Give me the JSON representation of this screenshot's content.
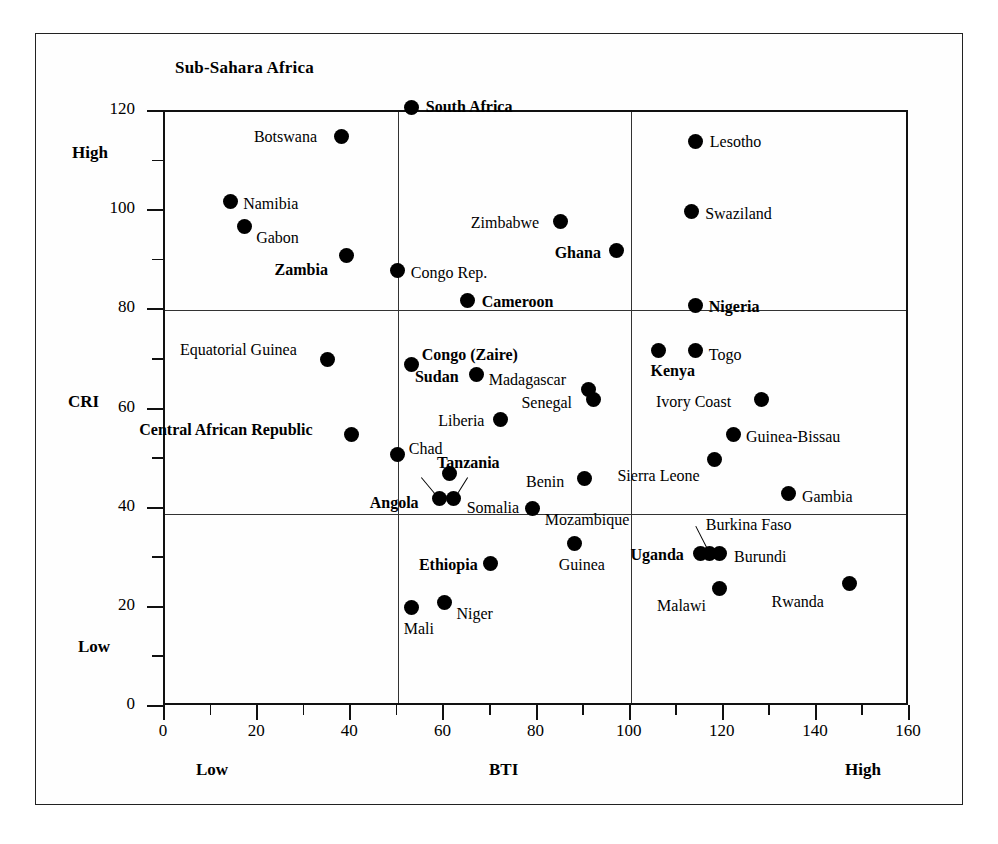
{
  "chart_data": {
    "type": "scatter",
    "title": "Sub-Sahara Africa",
    "xlabel": "BTI",
    "ylabel": "CRI",
    "xlim": [
      0,
      160
    ],
    "ylim": [
      0,
      120
    ],
    "xticks": [
      0,
      20,
      40,
      60,
      80,
      100,
      120,
      140,
      160
    ],
    "yticks": [
      0,
      20,
      40,
      60,
      80,
      100,
      120
    ],
    "xtick_minor_step": 10,
    "ytick_minor_step": 10,
    "grid": false,
    "legend": "none",
    "x_axis_low_label": "Low",
    "x_axis_high_label": "High",
    "y_axis_low_label": "Low",
    "y_axis_high_label": "High",
    "divider_x_values": [
      50,
      100
    ],
    "divider_y_values": [
      39,
      80
    ],
    "points": [
      {
        "name": "South Africa",
        "x": 53,
        "y": 121,
        "bold": true,
        "lx": 14,
        "ly": -8
      },
      {
        "name": "Botswana",
        "x": 38,
        "y": 115,
        "bold": false,
        "lx": -88,
        "ly": -8
      },
      {
        "name": "Lesotho",
        "x": 114,
        "y": 114,
        "bold": false,
        "lx": 14,
        "ly": -8
      },
      {
        "name": "Namibia",
        "x": 14,
        "y": 102,
        "bold": false,
        "lx": 13,
        "ly": -5
      },
      {
        "name": "Swaziland",
        "x": 113,
        "y": 100,
        "bold": false,
        "lx": 14,
        "ly": -5
      },
      {
        "name": "Gabon",
        "x": 17,
        "y": 97,
        "bold": false,
        "lx": 12,
        "ly": 4
      },
      {
        "name": "Zimbabwe",
        "x": 85,
        "y": 98,
        "bold": false,
        "lx": -90,
        "ly": -6
      },
      {
        "name": "Ghana",
        "x": 97,
        "y": 92,
        "bold": true,
        "lx": -62,
        "ly": -6
      },
      {
        "name": "Zambia",
        "x": 39,
        "y": 91,
        "bold": true,
        "lx": -72,
        "ly": 6
      },
      {
        "name": "Congo Rep.",
        "x": 50,
        "y": 88,
        "bold": false,
        "lx": 13,
        "ly": -6
      },
      {
        "name": "Cameroon",
        "x": 65,
        "y": 82,
        "bold": true,
        "lx": 14,
        "ly": -6
      },
      {
        "name": "Nigeria",
        "x": 114,
        "y": 81,
        "bold": true,
        "lx": 13,
        "ly": -6
      },
      {
        "name": "Equatorial Guinea",
        "x": 35,
        "y": 70,
        "bold": false,
        "lx": -148,
        "ly": -18
      },
      {
        "name": "Congo (Zaire)",
        "x": 53,
        "y": 69,
        "bold": true,
        "lx": 10,
        "ly": -18
      },
      {
        "name": "Kenya",
        "x": 106,
        "y": 72,
        "bold": true,
        "lx": -8,
        "ly": 13
      },
      {
        "name": "Togo",
        "x": 114,
        "y": 72,
        "bold": false,
        "lx": 13,
        "ly": -3
      },
      {
        "name": "Sudan",
        "x": 67,
        "y": 67,
        "bold": true,
        "lx": -62,
        "ly": -6
      },
      {
        "name": "Madagascar",
        "x": 91,
        "y": 64,
        "bold": false,
        "lx": -100,
        "ly": -18
      },
      {
        "name": "Senegal",
        "x": 92,
        "y": 62,
        "bold": false,
        "lx": -72,
        "ly": -5
      },
      {
        "name": "Ivory  Coast",
        "x": 128,
        "y": 62,
        "bold": false,
        "lx": -105,
        "ly": -6
      },
      {
        "name": "Liberia",
        "x": 72,
        "y": 58,
        "bold": false,
        "lx": -62,
        "ly": -6
      },
      {
        "name": "Central African Republic",
        "x": 40,
        "y": 55,
        "bold": true,
        "lx": -212,
        "ly": -12
      },
      {
        "name": "Guinea-Bissau",
        "x": 122,
        "y": 55,
        "bold": false,
        "lx": 13,
        "ly": -5
      },
      {
        "name": "Chad",
        "x": 50,
        "y": 51,
        "bold": false,
        "lx": 11,
        "ly": -13
      },
      {
        "name": "Sierra Leone",
        "x": 118,
        "y": 50,
        "bold": false,
        "lx": -97,
        "ly": 9
      },
      {
        "name": "Tanzania",
        "x": 61,
        "y": 47,
        "bold": true,
        "lx": -12,
        "ly": -19
      },
      {
        "name": "Benin",
        "x": 90,
        "y": 46,
        "bold": false,
        "lx": -58,
        "ly": -5
      },
      {
        "name": "Gambia",
        "x": 134,
        "y": 43,
        "bold": false,
        "lx": 13,
        "ly": -5
      },
      {
        "name": "Angola",
        "x": 59,
        "y": 42,
        "bold": true,
        "lx": -70,
        "ly": -4
      },
      {
        "name": "Somalia",
        "x": 62,
        "y": 42,
        "bold": false,
        "lx": 13,
        "ly": 1
      },
      {
        "name": "Mozambique",
        "x": 79,
        "y": 40,
        "bold": false,
        "lx": 12,
        "ly": 3
      },
      {
        "name": "Guinea",
        "x": 88,
        "y": 33,
        "bold": false,
        "lx": -16,
        "ly": 14
      },
      {
        "name": "Burkina Faso",
        "x": 117,
        "y": 31,
        "bold": false,
        "lx": -4,
        "ly": -36
      },
      {
        "name": "Uganda",
        "x": 115,
        "y": 31,
        "bold": true,
        "lx": -70,
        "ly": -6
      },
      {
        "name": "Burundi",
        "x": 119,
        "y": 31,
        "bold": false,
        "lx": 15,
        "ly": -4
      },
      {
        "name": "Ethiopia",
        "x": 70,
        "y": 29,
        "bold": true,
        "lx": -72,
        "ly": -6
      },
      {
        "name": "Rwanda",
        "x": 147,
        "y": 25,
        "bold": false,
        "lx": -78,
        "ly": 11
      },
      {
        "name": "Malawi",
        "x": 119,
        "y": 24,
        "bold": false,
        "lx": -62,
        "ly": 10
      },
      {
        "name": "Niger",
        "x": 60,
        "y": 21,
        "bold": false,
        "lx": 12,
        "ly": 3
      },
      {
        "name": "Mali",
        "x": 53,
        "y": 20,
        "bold": false,
        "lx": -8,
        "ly": 13
      }
    ],
    "leaders": [
      {
        "from_x": 59,
        "from_y": 42,
        "to_x": 55,
        "to_y": 46.5
      },
      {
        "from_x": 62,
        "from_y": 42,
        "to_x": 65,
        "to_y": 46.5
      },
      {
        "from_x": 117,
        "from_y": 31,
        "to_x": 114,
        "to_y": 36.5
      }
    ]
  }
}
